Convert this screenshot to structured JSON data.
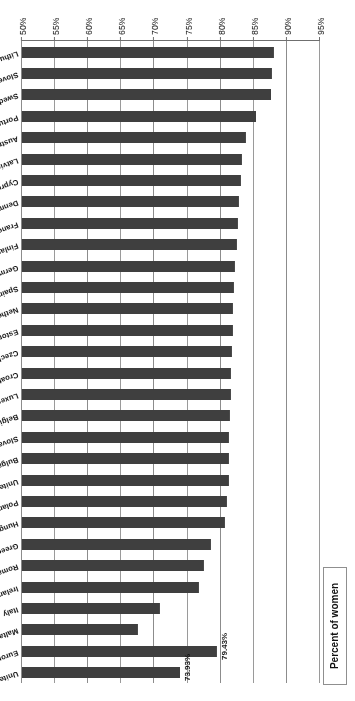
{
  "chart_data": {
    "type": "bar",
    "orientation": "horizontal",
    "title": "",
    "xlabel": "Percent of women",
    "ylabel": "",
    "axis_title": "Percent of women",
    "xlim": [
      50,
      95
    ],
    "xticks": [
      95,
      90,
      85,
      80,
      75,
      70,
      65,
      60,
      55,
      50
    ],
    "xtick_labels": [
      "95%",
      "90%",
      "85%",
      "80%",
      "75%",
      "70%",
      "65%",
      "60%",
      "55%",
      "50%"
    ],
    "grid": true,
    "legend": "none",
    "bar_color": "#3f3f3f",
    "categories": [
      "United States",
      "European Union",
      "Malta",
      "Italy",
      "Ireland",
      "Romania",
      "Greece",
      "Hungary",
      "Poland",
      "United Kingdom",
      "Bulgaria",
      "Slovak Republic",
      "Belgium",
      "Luxembourg",
      "Croatia",
      "Czech Republic",
      "Estonia",
      "Netherlands",
      "Spain",
      "Germany",
      "Finland",
      "France",
      "Denmark",
      "Cyprus",
      "Latvia",
      "Austria",
      "Portugal",
      "Sweden",
      "Slovenia",
      "Lithuania"
    ],
    "values": [
      73.93,
      79.43,
      67.5,
      70.8,
      76.7,
      77.5,
      78.6,
      80.6,
      81.0,
      81.2,
      81.3,
      81.3,
      81.4,
      81.5,
      81.6,
      81.7,
      81.8,
      81.9,
      82.0,
      82.2,
      82.5,
      82.6,
      82.8,
      83.0,
      83.2,
      83.8,
      85.4,
      87.6,
      87.8,
      88.0
    ],
    "data_labels": [
      {
        "category": "United States",
        "text": "73.93%"
      },
      {
        "category": "European Union",
        "text": "79.43%"
      }
    ]
  }
}
